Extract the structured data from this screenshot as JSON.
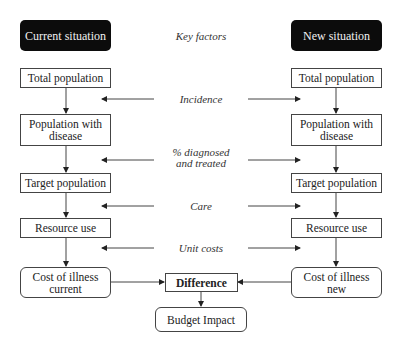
{
  "diagram": {
    "headers": {
      "current": "Current situation",
      "center": "Key factors",
      "new": "New situation"
    },
    "current_column": [
      "Total population",
      "Population with disease",
      "Target population",
      "Resource use",
      "Cost of illness current"
    ],
    "new_column": [
      "Total population",
      "Population with disease",
      "Target population",
      "Resource use",
      "Cost of illness new"
    ],
    "current_column_lines": [
      [
        "Total population"
      ],
      [
        "Population with",
        "disease"
      ],
      [
        "Target population"
      ],
      [
        "Resource use"
      ],
      [
        "Cost of illness",
        "current"
      ]
    ],
    "new_column_lines": [
      [
        "Total population"
      ],
      [
        "Population with",
        "disease"
      ],
      [
        "Target population"
      ],
      [
        "Resource use"
      ],
      [
        "Cost of illness",
        "new"
      ]
    ],
    "key_factors": [
      {
        "lines": [
          "Incidence"
        ]
      },
      {
        "lines": [
          "% diagnosed",
          "and treated"
        ]
      },
      {
        "lines": [
          "Care"
        ]
      },
      {
        "lines": [
          "Unit costs"
        ]
      }
    ],
    "difference": "Difference",
    "budget_impact": "Budget Impact"
  },
  "colors": {
    "header_bg": "#0c0c0c",
    "header_text": "#f2f2f2",
    "line": "#444444"
  }
}
